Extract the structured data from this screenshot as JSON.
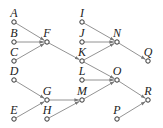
{
  "diagram": {
    "title": "",
    "colors": {
      "edge": "#777777",
      "node_stroke": "#333333",
      "label": "#222222",
      "background": "#ffffff"
    },
    "nodes": [
      {
        "id": "A",
        "label": "A",
        "x": 14,
        "y": 22
      },
      {
        "id": "B",
        "label": "B",
        "x": 14,
        "y": 42
      },
      {
        "id": "C",
        "label": "C",
        "x": 14,
        "y": 61
      },
      {
        "id": "D",
        "label": "D",
        "x": 14,
        "y": 80
      },
      {
        "id": "E",
        "label": "E",
        "x": 14,
        "y": 119
      },
      {
        "id": "F",
        "label": "F",
        "x": 47,
        "y": 42
      },
      {
        "id": "G",
        "label": "G",
        "x": 47,
        "y": 100
      },
      {
        "id": "H",
        "label": "H",
        "x": 47,
        "y": 119
      },
      {
        "id": "I",
        "label": "I",
        "x": 82,
        "y": 22
      },
      {
        "id": "J",
        "label": "J",
        "x": 82,
        "y": 42
      },
      {
        "id": "K",
        "label": "K",
        "x": 82,
        "y": 61
      },
      {
        "id": "L",
        "label": "L",
        "x": 82,
        "y": 80
      },
      {
        "id": "M",
        "label": "M",
        "x": 82,
        "y": 100
      },
      {
        "id": "N",
        "label": "N",
        "x": 117,
        "y": 42
      },
      {
        "id": "O",
        "label": "O",
        "x": 117,
        "y": 80
      },
      {
        "id": "P",
        "label": "P",
        "x": 117,
        "y": 119
      },
      {
        "id": "Q",
        "label": "Q",
        "x": 148,
        "y": 61
      },
      {
        "id": "R",
        "label": "R",
        "x": 148,
        "y": 100
      }
    ],
    "edges": [
      {
        "from": "A",
        "to": "F"
      },
      {
        "from": "B",
        "to": "F"
      },
      {
        "from": "C",
        "to": "F"
      },
      {
        "from": "F",
        "to": "K"
      },
      {
        "from": "D",
        "to": "G"
      },
      {
        "from": "E",
        "to": "G"
      },
      {
        "from": "G",
        "to": "M"
      },
      {
        "from": "H",
        "to": "M"
      },
      {
        "from": "I",
        "to": "N"
      },
      {
        "from": "J",
        "to": "N"
      },
      {
        "from": "K",
        "to": "N"
      },
      {
        "from": "N",
        "to": "Q"
      },
      {
        "from": "K",
        "to": "O"
      },
      {
        "from": "L",
        "to": "O"
      },
      {
        "from": "M",
        "to": "O"
      },
      {
        "from": "O",
        "to": "R"
      },
      {
        "from": "P",
        "to": "R"
      }
    ]
  }
}
